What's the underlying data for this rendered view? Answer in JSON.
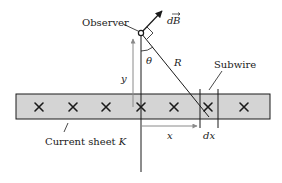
{
  "diagram": {
    "labels": {
      "observer": "Observer",
      "dB_d": "d",
      "dB_B": "B",
      "theta": "θ",
      "R": "R",
      "subwire": "Subwire",
      "y": "y",
      "x": "x",
      "dx": "dx",
      "current_sheet": "Current sheet ",
      "current_sheet_symbol": "K"
    },
    "current_direction_symbol": "×",
    "cross_count": 7,
    "colors": {
      "sheet_fill": "#d4d4d4",
      "line": "#1a1a1a",
      "gray_arrow": "#8a8a8a"
    }
  }
}
